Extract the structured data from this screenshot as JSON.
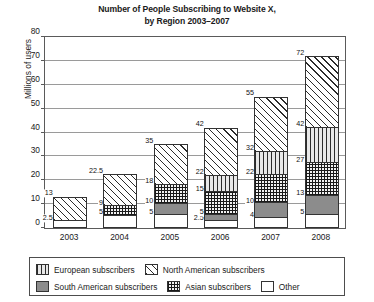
{
  "chart_data": {
    "type": "bar",
    "stacked": true,
    "title_line1": "Number of People Subscribing to Website X,",
    "title_line2": "by Region 2003–2007",
    "title_italic_token": "X",
    "xlabel": "",
    "ylabel": "Millions of users",
    "ylim": [
      0,
      80
    ],
    "yticks": [
      0,
      10,
      20,
      30,
      40,
      50,
      60,
      70,
      80
    ],
    "grid": true,
    "legend_position": "bottom",
    "categories": [
      "2003",
      "2004",
      "2005",
      "2006",
      "2007",
      "2008"
    ],
    "series": [
      {
        "name": "Other",
        "fill": "other",
        "values": [
          2.5,
          5,
          5,
          2.5,
          4,
          5
        ]
      },
      {
        "name": "South American subscribers",
        "fill": "south",
        "values": [
          0,
          0,
          5,
          2.5,
          6,
          8
        ]
      },
      {
        "name": "Asian subscribers",
        "fill": "asian",
        "values": [
          0,
          4,
          8,
          10,
          12,
          14
        ]
      },
      {
        "name": "European subscribers",
        "fill": "euro",
        "values": [
          0,
          0,
          0,
          7,
          10,
          15
        ]
      },
      {
        "name": "North American subscribers",
        "fill": "north",
        "values": [
          10.5,
          13.5,
          17,
          20,
          23,
          30
        ]
      }
    ],
    "totals": [
      13,
      22.5,
      35,
      42,
      55,
      72
    ],
    "cumulative_labels": [
      [
        "2.5",
        "13"
      ],
      [
        "5",
        "9",
        "22.5"
      ],
      [
        "5",
        "10",
        "18",
        "35"
      ],
      [
        "2.5",
        "5",
        "15",
        "22",
        "42"
      ],
      [
        "4",
        "10",
        "22",
        "32",
        "55"
      ],
      [
        "5",
        "13",
        "27",
        "42",
        "72"
      ]
    ],
    "cumulative_values": [
      [
        2.5,
        13
      ],
      [
        5,
        9,
        22.5
      ],
      [
        5,
        10,
        18,
        35
      ],
      [
        2.5,
        5,
        15,
        22,
        42
      ],
      [
        4,
        10,
        22,
        32,
        55
      ],
      [
        5,
        13,
        27,
        42,
        72
      ]
    ]
  },
  "legend": {
    "items": [
      {
        "label": "European subscribers",
        "fill": "euro"
      },
      {
        "label": "North American subscribers",
        "fill": "north"
      },
      {
        "label": "South American subscribers",
        "fill": "south"
      },
      {
        "label": "Asian subscribers",
        "fill": "asian"
      },
      {
        "label": "Other",
        "fill": "other"
      }
    ]
  }
}
